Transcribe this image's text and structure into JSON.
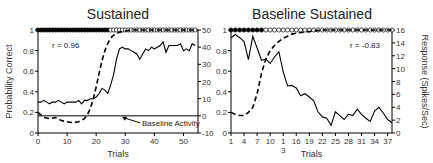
{
  "chart_data": [
    {
      "type": "line",
      "title": "Sustained",
      "xlabel": "Trials",
      "ylabel": "Probability Correct",
      "y2label": "",
      "xlim": [
        0,
        55
      ],
      "ylim": [
        0,
        1
      ],
      "y2lim": [
        -10,
        50
      ],
      "xticks": [
        0,
        10,
        20,
        30,
        40,
        50
      ],
      "xtick_labels": [
        "0",
        "10",
        "20",
        "30",
        "40",
        "50"
      ],
      "yticks": [
        0,
        0.2,
        0.4,
        0.6,
        0.8,
        1
      ],
      "ytick_labels": [
        "0",
        "0.2",
        "0.4",
        "0.6",
        "0.8",
        "1"
      ],
      "y2ticks": [
        -10,
        0,
        10,
        20,
        30,
        40,
        50
      ],
      "y2tick_labels": [
        "-10",
        "0",
        "10",
        "20",
        "30",
        "40",
        "50"
      ],
      "annotation_r": "r = 0.96",
      "baseline_label": "Baseline Activity",
      "baseline_value": 0,
      "markers": {
        "filled_until_trial": 24,
        "total_trials": 55
      },
      "series": [
        {
          "name": "Probability Correct (dashed)",
          "axis": "left",
          "style": "dashed",
          "x": [
            0,
            2,
            4,
            6,
            8,
            10,
            12,
            14,
            16,
            17,
            18,
            19,
            20,
            21,
            22,
            23,
            24,
            25,
            26,
            28,
            30,
            32,
            35,
            40,
            45,
            50,
            55
          ],
          "y": [
            0.2,
            0.15,
            0.14,
            0.15,
            0.12,
            0.11,
            0.1,
            0.11,
            0.14,
            0.18,
            0.24,
            0.33,
            0.45,
            0.58,
            0.7,
            0.8,
            0.87,
            0.92,
            0.95,
            0.98,
            0.99,
            1.0,
            1.0,
            1.0,
            1.0,
            1.0,
            1.0
          ]
        },
        {
          "name": "Response (solid)",
          "axis": "right",
          "style": "solid",
          "x": [
            0,
            1,
            2,
            3,
            4,
            5,
            6,
            7,
            8,
            9,
            10,
            11,
            12,
            13,
            14,
            15,
            16,
            17,
            18,
            19,
            20,
            21,
            22,
            23,
            24,
            25,
            26,
            27,
            28,
            29,
            30,
            31,
            32,
            33,
            34,
            35,
            36,
            37,
            38,
            39,
            40,
            41,
            42,
            43,
            44,
            45,
            46,
            47,
            48,
            49,
            50,
            51,
            52,
            53,
            54
          ],
          "y": [
            8,
            8,
            9,
            8,
            7,
            8,
            8,
            9,
            8,
            7,
            8,
            8,
            8,
            8,
            9,
            7,
            9,
            9,
            10,
            10,
            11,
            13,
            16,
            15,
            13,
            18,
            24,
            33,
            39,
            40,
            39,
            39,
            38,
            37,
            36,
            33,
            36,
            39,
            38,
            40,
            39,
            40,
            41,
            43,
            37,
            41,
            41,
            41,
            41,
            42,
            38,
            39,
            38,
            42,
            41
          ]
        }
      ]
    },
    {
      "type": "line",
      "title": "Baseline Sustained",
      "xlabel": "Trials",
      "ylabel": "",
      "y2label": "Response (Spikes/Sec)",
      "xlim": [
        1,
        38
      ],
      "ylim": [
        0,
        1
      ],
      "y2lim": [
        0,
        16
      ],
      "xticks": [
        1,
        4,
        7,
        10,
        13,
        16,
        19,
        22,
        25,
        28,
        31,
        34,
        37
      ],
      "xtick_labels": [
        "1",
        "4",
        "7",
        "10",
        "1",
        "16",
        "19",
        "22",
        "25",
        "28",
        "31",
        "34",
        "37"
      ],
      "xtick_sublabel": "3",
      "yticks": [
        0,
        0.2,
        0.4,
        0.6,
        0.8,
        1
      ],
      "ytick_labels": [
        "0",
        "0.2",
        "0.4",
        "0.6",
        "0.8",
        "1"
      ],
      "y2ticks": [
        0,
        2,
        4,
        6,
        8,
        10,
        12,
        14,
        16
      ],
      "y2tick_labels": [
        "0",
        "2",
        "4",
        "6",
        "8",
        "10",
        "12",
        "14",
        "16"
      ],
      "annotation_r": "r = -0.83",
      "markers": {
        "filled_until_trial": 8,
        "total_trials": 38
      },
      "series": [
        {
          "name": "Probability Correct (dashed)",
          "axis": "left",
          "style": "dashed",
          "x": [
            1,
            2,
            3,
            4,
            5,
            6,
            7,
            8,
            9,
            10,
            11,
            12,
            13,
            14,
            15,
            16,
            18,
            20,
            22,
            25,
            30,
            38
          ],
          "y": [
            0.2,
            0.18,
            0.17,
            0.17,
            0.2,
            0.25,
            0.38,
            0.58,
            0.72,
            0.8,
            0.85,
            0.89,
            0.92,
            0.94,
            0.96,
            0.97,
            0.98,
            0.99,
            1.0,
            1.0,
            1.0,
            1.0
          ]
        },
        {
          "name": "Response (solid)",
          "axis": "right",
          "style": "solid",
          "x": [
            1,
            2,
            3,
            4,
            5,
            6,
            7,
            8,
            9,
            10,
            11,
            12,
            13,
            14,
            15,
            16,
            17,
            18,
            19,
            20,
            21,
            22,
            23,
            24,
            25,
            26,
            27,
            28,
            29,
            30,
            31,
            32,
            33,
            34,
            35,
            36,
            37,
            38
          ],
          "y": [
            14.8,
            15.3,
            14.8,
            14.2,
            11.4,
            15.0,
            13.2,
            11.3,
            11.5,
            10.8,
            11.8,
            12.6,
            9.5,
            7.3,
            7.4,
            7.0,
            5.8,
            6.1,
            5.6,
            5.0,
            3.3,
            2.5,
            2.3,
            1.2,
            3.3,
            2.7,
            2.1,
            2.9,
            2.7,
            3.7,
            2.9,
            2.3,
            1.8,
            3.4,
            4.0,
            3.1,
            2.1,
            1.6
          ]
        }
      ]
    }
  ]
}
